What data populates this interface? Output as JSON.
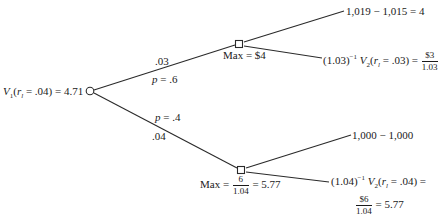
{
  "diagram": {
    "type": "decision-tree",
    "colors": {
      "line": "#2a2a2a",
      "text": "#1a1a1a",
      "background": "#ffffff"
    },
    "root": {
      "node_shape": "circle",
      "label_prefix": "V",
      "label_sub": "1",
      "label_arg_open": "(",
      "label_arg_var": "r",
      "label_arg_var_sub": "l",
      "label_arg_rest": " = .04) = 4.71"
    },
    "branches": {
      "up": {
        "rate": ".03",
        "prob_var": "p",
        "prob_rest": " = .6"
      },
      "down": {
        "rate": ".04",
        "prob_var": "p",
        "prob_rest": " = .4"
      }
    },
    "decision_up": {
      "node_shape": "square",
      "max_label": "Max = $4",
      "leaf_exercise": "1,019 − 1,015 = 4",
      "leaf_continue_prefix": "(1.03)",
      "leaf_continue_exp": "−1",
      "leaf_continue_v": "V",
      "leaf_continue_v_sub": "2",
      "leaf_continue_arg_open": "(",
      "leaf_continue_arg_var": "r",
      "leaf_continue_arg_var_sub": "l",
      "leaf_continue_arg_rest": " = .03) =",
      "leaf_continue_frac_num": "$3",
      "leaf_continue_frac_den": "1.03"
    },
    "decision_down": {
      "node_shape": "square",
      "max_prefix": "Max =",
      "max_frac_num": "6",
      "max_frac_den": "1.04",
      "max_suffix": "= 5.77",
      "leaf_exercise": "1,000 − 1,000",
      "leaf_continue_prefix": "(1.04)",
      "leaf_continue_exp": "−1",
      "leaf_continue_v": "V",
      "leaf_continue_v_sub": "2",
      "leaf_continue_arg_open": "(",
      "leaf_continue_arg_var": "r",
      "leaf_continue_arg_var_sub": "l",
      "leaf_continue_arg_rest": " = .04) =",
      "leaf_continue_frac_num": "$6",
      "leaf_continue_frac_den": "1.04",
      "leaf_continue_result": "= 5.77"
    }
  }
}
